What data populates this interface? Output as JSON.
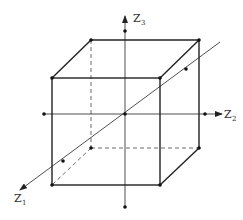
{
  "diagram": {
    "type": "cube-with-axes",
    "axes": [
      {
        "name": "Z1",
        "base": "Z",
        "sub": "1"
      },
      {
        "name": "Z2",
        "base": "Z",
        "sub": "2"
      },
      {
        "name": "Z3",
        "base": "Z",
        "sub": "3"
      }
    ],
    "colors": {
      "stroke": "#222222",
      "background": "#ffffff"
    }
  }
}
